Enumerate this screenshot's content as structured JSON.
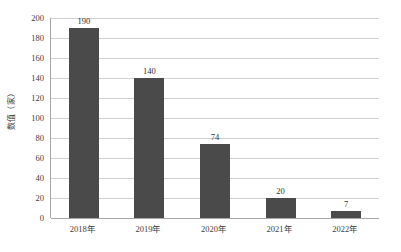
{
  "chart_data": {
    "type": "bar",
    "title": "",
    "xlabel": "",
    "ylabel": "数值（家）",
    "categories": [
      "2018年",
      "2019年",
      "2020年",
      "2021年",
      "2022年"
    ],
    "values": [
      190,
      140,
      74,
      20,
      7
    ],
    "value_labels": [
      "190",
      "140",
      "74",
      "20",
      "7"
    ],
    "ylim": [
      0,
      200
    ],
    "ytick_step": 20,
    "ytick_labels": [
      "0",
      "20",
      "40",
      "60",
      "80",
      "100",
      "120",
      "140",
      "160",
      "180",
      "200"
    ],
    "grid": true,
    "legend": false,
    "legend_position": "none",
    "bar_color": "#4a4a4a",
    "gridline_color": "#d0d0d0",
    "axis_color": "#a6a6a6",
    "background_color": "#ffffff"
  }
}
